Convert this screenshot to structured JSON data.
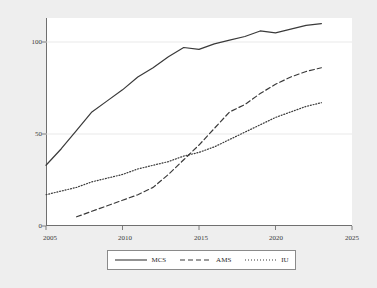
{
  "chart_data": {
    "type": "line",
    "title": "",
    "subtitle": "",
    "xlabel": "",
    "ylabel": "",
    "xlim": [
      2005,
      2025
    ],
    "ylim": [
      0,
      115
    ],
    "xticks": [
      2005,
      2010,
      2015,
      2020,
      2025
    ],
    "yticks": [
      0,
      50,
      100
    ],
    "grid": true,
    "grid_axis": "y",
    "legend_position": "bottom",
    "background": "#eeeeee",
    "plot_background": "#ffffff",
    "series": [
      {
        "name": "MCS",
        "style": "solid",
        "color": "#3a3a3a",
        "x": [
          2005,
          2006,
          2007,
          2008,
          2009,
          2010,
          2011,
          2012,
          2013,
          2014,
          2015,
          2016,
          2017,
          2018,
          2019,
          2020,
          2021,
          2022,
          2023
        ],
        "values": [
          33,
          42,
          52,
          62,
          68,
          74,
          81,
          86,
          92,
          97,
          96,
          99,
          101,
          103,
          106,
          105,
          107,
          109,
          110
        ]
      },
      {
        "name": "AMS",
        "style": "dashed",
        "color": "#3a3a3a",
        "x": [
          2007,
          2008,
          2009,
          2010,
          2011,
          2012,
          2013,
          2014,
          2015,
          2016,
          2017,
          2018,
          2019,
          2020,
          2021,
          2022,
          2023
        ],
        "values": [
          5,
          8,
          11,
          14,
          17,
          21,
          28,
          36,
          44,
          53,
          62,
          66,
          72,
          77,
          81,
          84,
          86
        ]
      },
      {
        "name": "IU",
        "style": "dotted",
        "color": "#3a3a3a",
        "x": [
          2005,
          2006,
          2007,
          2008,
          2009,
          2010,
          2011,
          2012,
          2013,
          2014,
          2015,
          2016,
          2017,
          2018,
          2019,
          2020,
          2021,
          2022,
          2023
        ],
        "values": [
          17,
          19,
          21,
          24,
          26,
          28,
          31,
          33,
          35,
          38,
          40,
          43,
          47,
          51,
          55,
          59,
          62,
          65,
          67
        ]
      }
    ],
    "legend": [
      {
        "label": "MCS",
        "style": "solid"
      },
      {
        "label": "AMS",
        "style": "dashed"
      },
      {
        "label": "IU",
        "style": "dotted"
      }
    ]
  },
  "axis": {
    "y_labels": [
      "100",
      "50",
      "0"
    ],
    "x_labels": [
      "2005",
      "2010",
      "2015",
      "2020",
      "2025"
    ]
  }
}
